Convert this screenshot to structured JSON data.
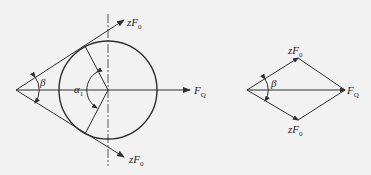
{
  "diagram": {
    "title": "",
    "colors": {
      "background": "#f2f2f2",
      "line": "#2f2f2f"
    },
    "left_figure": {
      "description": "Pulley with belt tensions forming wrap angle",
      "labels": {
        "upper_force": "zF",
        "upper_force_sub": "0",
        "lower_force": "zF",
        "lower_force_sub": "0",
        "resultant": "F",
        "resultant_sub": "Q",
        "angle_beta": "β",
        "angle_alpha": "α",
        "angle_alpha_sub": "1"
      }
    },
    "right_figure": {
      "description": "Force parallelogram (rhombus) of belt tensions and resultant",
      "labels": {
        "upper_force": "zF",
        "upper_force_sub": "0",
        "lower_force": "zF",
        "lower_force_sub": "0",
        "resultant": "F",
        "resultant_sub": "Q",
        "angle_beta": "β"
      }
    }
  }
}
